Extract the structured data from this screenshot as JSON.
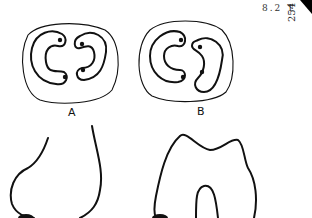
{
  "header": {
    "section_code": "8.2 T",
    "page_number": "254"
  },
  "figure": {
    "panels": [
      {
        "id": "A",
        "label": "A",
        "description": "occlusal outline with two C-shaped canals and four dots"
      },
      {
        "id": "B",
        "label": "B",
        "description": "occlusal outline with two C-shaped canals, variant"
      }
    ],
    "lower_panels": [
      {
        "id": "lower-left",
        "description": "tooth profile outline, left"
      },
      {
        "id": "lower-right",
        "description": "tooth profile outline with root notch, right"
      }
    ]
  }
}
